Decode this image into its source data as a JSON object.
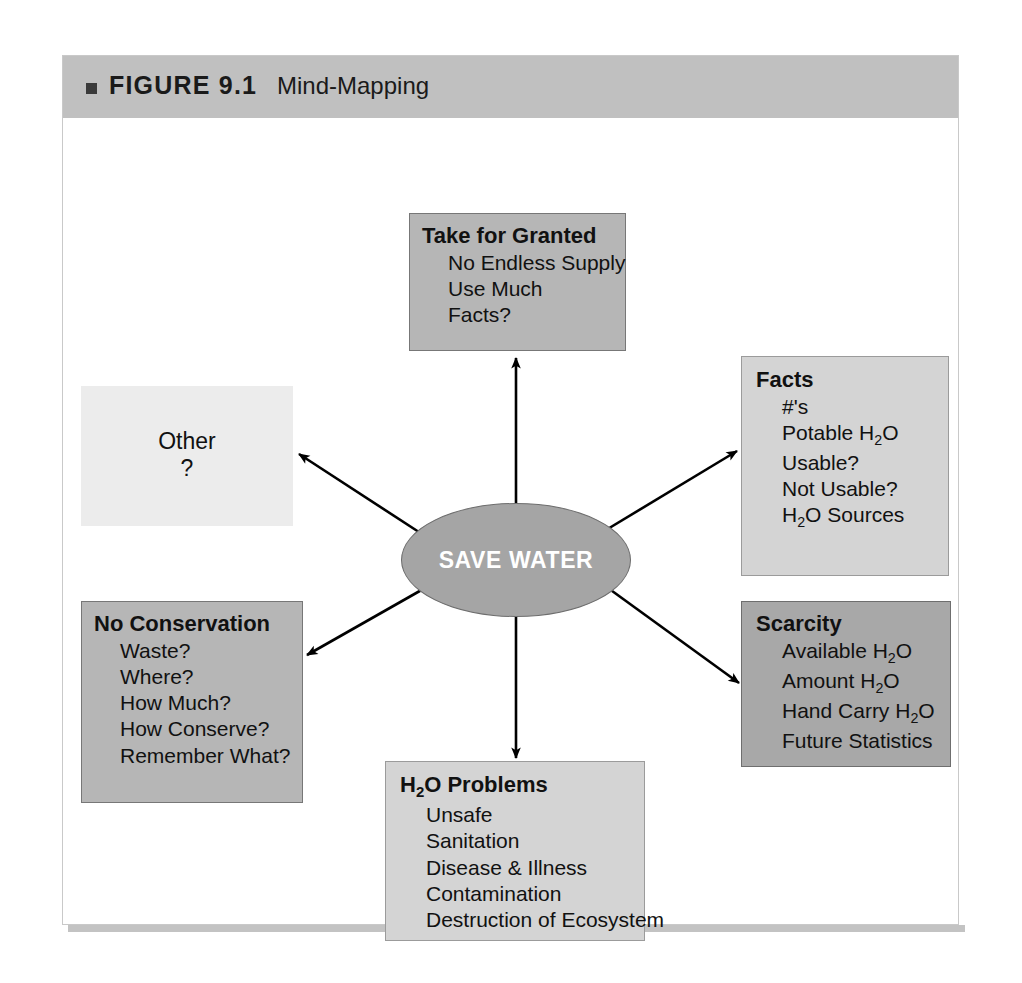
{
  "figure": {
    "label": "FIGURE 9.1",
    "title": "Mind-Mapping",
    "marker": "square-bullet-icon"
  },
  "center": {
    "label": "SAVE WATER",
    "shape": "ellipse",
    "fill": "#a5a5a5",
    "text_color": "#ffffff"
  },
  "nodes": [
    {
      "id": "take-for-granted",
      "title": "Take for Granted",
      "items": [
        "No Endless Supply",
        "Use Much",
        "Facts?"
      ],
      "fill": "#b6b6b6",
      "position": "top"
    },
    {
      "id": "facts",
      "title": "Facts",
      "items": [
        "#'s",
        "Potable H2O",
        "Usable?",
        "Not Usable?",
        "H2O Sources"
      ],
      "items_html": [
        "#'s",
        "Potable H<sub>2</sub>O",
        "Usable?",
        "Not Usable?",
        "H<sub>2</sub>O Sources"
      ],
      "fill": "#d4d4d4",
      "position": "right-top"
    },
    {
      "id": "scarcity",
      "title": "Scarcity",
      "items": [
        "Available H2O",
        "Amount H2O",
        "Hand Carry H2O",
        "Future Statistics"
      ],
      "items_html": [
        "Available H<sub>2</sub>O",
        "Amount H<sub>2</sub>O",
        "Hand Carry H<sub>2</sub>O",
        "Future Statistics"
      ],
      "fill": "#a8a8a8",
      "position": "right-bottom"
    },
    {
      "id": "no-conservation",
      "title": "No Conservation",
      "items": [
        "Waste?",
        "Where?",
        "How Much?",
        "How Conserve?",
        "Remember What?"
      ],
      "fill": "#b6b6b6",
      "position": "left-bottom"
    },
    {
      "id": "h2o-problems",
      "title": "H2O Problems",
      "title_html": "H<sub>2</sub>O Problems",
      "items": [
        "Unsafe",
        "Sanitation",
        "Disease & Illness",
        "Contamination",
        "Destruction of Ecosystem"
      ],
      "fill": "#d4d4d4",
      "position": "bottom"
    },
    {
      "id": "other",
      "title": "Other",
      "items": [
        "?"
      ],
      "fill": "#ececec",
      "position": "left-top"
    }
  ],
  "connectors": [
    {
      "from": "center",
      "to": "take-for-granted",
      "direction": "up"
    },
    {
      "from": "center",
      "to": "facts",
      "direction": "up-right"
    },
    {
      "from": "center",
      "to": "scarcity",
      "direction": "down-right"
    },
    {
      "from": "center",
      "to": "h2o-problems",
      "direction": "down"
    },
    {
      "from": "center",
      "to": "no-conservation",
      "direction": "down-left"
    },
    {
      "from": "center",
      "to": "other",
      "direction": "up-left"
    }
  ]
}
